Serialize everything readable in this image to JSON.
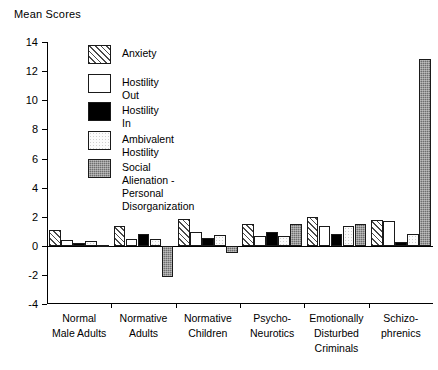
{
  "chart_data": {
    "type": "bar",
    "title": "Mean Scores",
    "xlabel": "",
    "ylabel": "Mean Scores",
    "ylim": [
      -4,
      14
    ],
    "yticks": [
      14,
      12,
      10,
      8,
      6,
      4,
      2,
      0,
      -2,
      -4
    ],
    "grid": false,
    "legend_position": "upper-left-inside",
    "categories": [
      "Normal\nMale Adults",
      "Normative\nAdults",
      "Normative\nChildren",
      "Psycho-\nNeurotics",
      "Emotionally\nDisturbed\nCriminals",
      "Schizo-\nphrenics"
    ],
    "series": [
      {
        "name": "Anxiety",
        "swatch": "diagonal-hatch",
        "values": [
          1.1,
          1.4,
          1.85,
          1.5,
          2.0,
          1.8
        ]
      },
      {
        "name": "Hostility Out",
        "swatch": "white",
        "values": [
          0.4,
          0.5,
          0.95,
          0.7,
          1.4,
          1.75
        ]
      },
      {
        "name": "Hostility In",
        "swatch": "black",
        "values": [
          0.2,
          0.8,
          0.55,
          0.95,
          0.8,
          0.25
        ]
      },
      {
        "name": "Ambivalent Hostility",
        "swatch": "light-dotted",
        "values": [
          0.35,
          0.45,
          0.75,
          0.7,
          1.4,
          0.8
        ]
      },
      {
        "name": "Social Alienation -\nPersonal Disorganization",
        "swatch": "dark-textured",
        "values": [
          0.1,
          -2.1,
          -0.5,
          1.5,
          1.5,
          12.8
        ]
      }
    ]
  }
}
